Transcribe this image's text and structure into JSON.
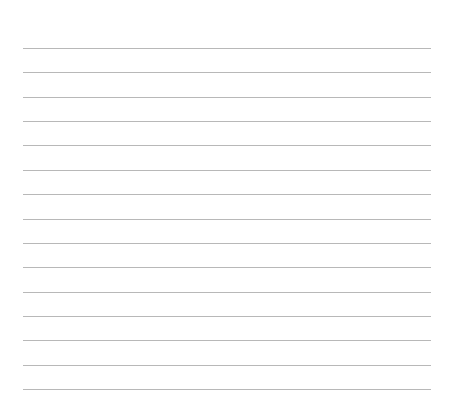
{
  "page": {
    "type": "lined-paper",
    "line_count": 15,
    "line_color": "#b8b8b8",
    "background": "#ffffff",
    "first_line_y": 48,
    "line_spacing": 24.36
  }
}
